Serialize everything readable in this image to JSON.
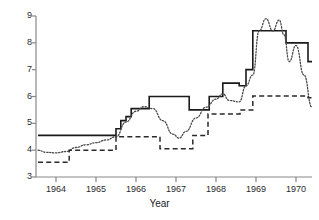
{
  "chart_data": {
    "type": "line",
    "title": "",
    "xlabel": "Year",
    "ylabel": "",
    "xlim": [
      1963.5,
      1970.4
    ],
    "ylim": [
      3,
      9
    ],
    "grid": false,
    "legend": "none",
    "xticks": [
      1964,
      1965,
      1966,
      1967,
      1968,
      1969,
      1970
    ],
    "xtick_labels": [
      "1964",
      "1965",
      "1966",
      "1967",
      "1968",
      "1969",
      "1970"
    ],
    "yticks": [
      3,
      4,
      5,
      6,
      7,
      8,
      9
    ],
    "ytick_labels": [
      "3",
      "4",
      "5",
      "6",
      "7",
      "8",
      "9"
    ],
    "series": [
      {
        "name": "solid-series",
        "style": "solid",
        "color": "#1a1a1a",
        "interpolation": "step",
        "x": [
          1963.55,
          1965.42,
          1965.5,
          1965.62,
          1965.75,
          1965.88,
          1966.0,
          1966.33,
          1966.67,
          1967.33,
          1967.5,
          1967.83,
          1968.0,
          1968.17,
          1968.42,
          1968.58,
          1968.75,
          1968.92,
          1969.58,
          1969.75,
          1970.17,
          1970.3,
          1970.4
        ],
        "y": [
          4.55,
          4.55,
          4.8,
          5.1,
          5.25,
          5.55,
          5.55,
          6.0,
          6.0,
          5.5,
          5.5,
          6.0,
          6.0,
          6.5,
          6.5,
          6.4,
          7.0,
          8.45,
          8.45,
          8.0,
          8.0,
          7.3,
          7.3
        ]
      },
      {
        "name": "dotted-series",
        "style": "dotted",
        "color": "#4a4a4a",
        "interpolation": "smooth-step",
        "x": [
          1963.55,
          1963.75,
          1964.0,
          1964.25,
          1964.5,
          1964.75,
          1965.0,
          1965.25,
          1965.5,
          1965.75,
          1966.0,
          1966.2,
          1966.42,
          1966.67,
          1966.92,
          1967.08,
          1967.25,
          1967.5,
          1967.75,
          1968.0,
          1968.17,
          1968.33,
          1968.58,
          1968.75,
          1968.92,
          1969.08,
          1969.25,
          1969.42,
          1969.58,
          1969.7,
          1969.83,
          1970.0,
          1970.2,
          1970.4
        ],
        "y": [
          4.0,
          3.92,
          3.9,
          3.95,
          4.1,
          4.2,
          4.28,
          4.38,
          4.5,
          5.05,
          5.45,
          5.62,
          5.55,
          5.1,
          4.6,
          4.45,
          4.7,
          5.2,
          5.6,
          5.9,
          6.1,
          5.85,
          5.8,
          6.4,
          6.8,
          8.45,
          8.9,
          8.45,
          8.85,
          8.3,
          7.3,
          7.9,
          6.8,
          5.6
        ]
      },
      {
        "name": "dashed-series",
        "style": "dashed",
        "color": "#2a2a2a",
        "interpolation": "step",
        "x": [
          1963.55,
          1964.25,
          1964.33,
          1965.4,
          1965.5,
          1966.5,
          1966.6,
          1967.33,
          1967.42,
          1967.7,
          1967.8,
          1968.5,
          1968.6,
          1968.75,
          1968.92,
          1970.1,
          1970.3,
          1970.4
        ],
        "y": [
          3.55,
          3.55,
          4.0,
          4.0,
          4.5,
          4.5,
          4.05,
          4.05,
          4.55,
          4.55,
          5.35,
          5.35,
          5.5,
          5.5,
          6.02,
          6.02,
          5.95,
          5.95
        ]
      }
    ]
  },
  "axis": {
    "x_title": "Year"
  }
}
